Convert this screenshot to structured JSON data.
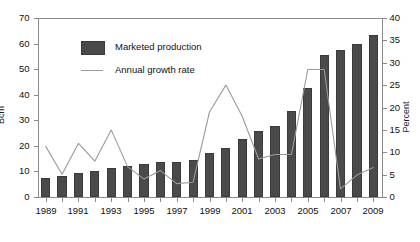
{
  "chart_data": {
    "type": "bar",
    "title": "",
    "subtitle": "",
    "xlabel": "",
    "ylabel": "Bcm",
    "y2label": "Percent",
    "ylim": [
      0,
      70
    ],
    "y2lim": [
      0,
      40
    ],
    "yticks": [
      0,
      10,
      20,
      30,
      40,
      50,
      60,
      70
    ],
    "y2ticks": [
      0,
      5,
      10,
      15,
      20,
      25,
      30,
      35,
      40
    ],
    "grid": false,
    "legend_position": "upper-left-inside",
    "categories": [
      "1989",
      "1990",
      "1991",
      "1992",
      "1993",
      "1994",
      "1995",
      "1996",
      "1997",
      "1998",
      "1999",
      "2000",
      "2001",
      "2002",
      "2003",
      "2004",
      "2005",
      "2006",
      "2007",
      "2008",
      "2009"
    ],
    "xtick_labels": [
      "1989",
      "1991",
      "1993",
      "1995",
      "1997",
      "1999",
      "2001",
      "2003",
      "2005",
      "2007",
      "2009"
    ],
    "series": [
      {
        "name": "Marketed production",
        "type": "bar",
        "axis": "left",
        "unit": "Bcm",
        "color": "#4a4a4a",
        "values": [
          7.5,
          8.3,
          9.2,
          10.0,
          11.5,
          12.3,
          12.9,
          13.7,
          13.8,
          14.5,
          17.2,
          19.3,
          22.8,
          26.0,
          27.9,
          33.5,
          42.7,
          55.5,
          57.5,
          59.9,
          63.2
        ]
      },
      {
        "name": "Annual growth rate",
        "type": "line",
        "axis": "right",
        "unit": "Percent",
        "color": "#9a9a9a",
        "values": [
          11.3,
          5.1,
          12.0,
          8.0,
          15.0,
          6.8,
          4.0,
          5.9,
          3.0,
          3.3,
          19.0,
          25.0,
          18.0,
          8.5,
          9.5,
          9.5,
          28.5,
          28.5,
          1.8,
          4.9,
          6.6
        ]
      }
    ]
  },
  "legend": {
    "items": [
      {
        "label": "Marketed production",
        "marker": "bar-swatch"
      },
      {
        "label": "Annual growth rate",
        "marker": "line-swatch"
      }
    ]
  },
  "colors": {
    "bar": "#4a4a4a",
    "line": "#9a9a9a",
    "axis": "#8a8a8a",
    "text": "#111111",
    "background": "#ffffff"
  }
}
